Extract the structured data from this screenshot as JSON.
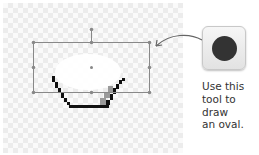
{
  "canvas": {
    "bounding_box": {
      "left": 33,
      "top": 42,
      "right": 149,
      "bottom": 92
    },
    "rotation_handle": {
      "x": 91,
      "y": 29
    },
    "center_handle": {
      "x": 91,
      "y": 67
    }
  },
  "tool": {
    "icon": "oval-tool-icon",
    "glyph_color": "#333333"
  },
  "caption": {
    "lines": [
      "Use this",
      "tool to",
      "draw",
      "an oval."
    ]
  }
}
